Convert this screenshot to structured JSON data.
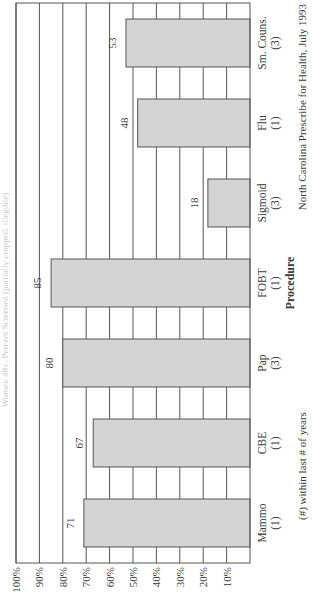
{
  "chart_data": {
    "type": "bar",
    "orientation": "rotated-90-ccw",
    "title": "Women 40+, Percent Screened (partially cropped, illegible)",
    "xlabel": "Procedure",
    "ylabel": "",
    "ylim": [
      0,
      100
    ],
    "yticks": [
      "10%",
      "20%",
      "30%",
      "40%",
      "50%",
      "60%",
      "70%",
      "80%",
      "90%",
      "100%"
    ],
    "ytick_values": [
      10,
      20,
      30,
      40,
      50,
      60,
      70,
      80,
      90,
      100
    ],
    "grid": true,
    "categories": [
      {
        "name": "Mammo",
        "interval": "(1)"
      },
      {
        "name": "CBE",
        "interval": "(1)"
      },
      {
        "name": "Pap",
        "interval": "(3)"
      },
      {
        "name": "FOBT",
        "interval": "(1)"
      },
      {
        "name": "Sigmoid",
        "interval": "(3)"
      },
      {
        "name": "Flu",
        "interval": "(1)"
      },
      {
        "name": "Sm. Couns.",
        "interval": "(3)"
      }
    ],
    "values": [
      71,
      67,
      80,
      85,
      18,
      48,
      53
    ],
    "data_labels": [
      "71",
      "67",
      "80",
      "85",
      "18",
      "48",
      "53"
    ],
    "footnote": "(#) within last # of years",
    "source": "North Carolina Prescribe for Health, July 1993",
    "colors": {
      "bar_fill": "#d4d4d4",
      "bar_stroke": "#555555",
      "grid": "#555555",
      "background": "#ffffff"
    }
  }
}
